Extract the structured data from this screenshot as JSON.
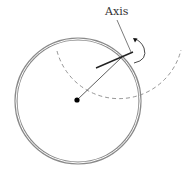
{
  "diagram": {
    "labels": {
      "axis": "Axis"
    },
    "colors": {
      "ring": "#8a8a8a",
      "line": "#333333",
      "dashed": "#8a8a8a",
      "pivot": "#000000",
      "background": "#ffffff"
    },
    "elements": [
      {
        "type": "double-ring-circle",
        "name": "wheel-rim"
      },
      {
        "type": "dashed-arc",
        "name": "swing-path"
      },
      {
        "type": "dot",
        "name": "pivot-point"
      },
      {
        "type": "line",
        "name": "radius-line"
      },
      {
        "type": "line",
        "name": "axis-bar"
      },
      {
        "type": "leader-line",
        "name": "axis-leader"
      },
      {
        "type": "curved-arrow",
        "name": "rotation-arrow"
      }
    ]
  }
}
